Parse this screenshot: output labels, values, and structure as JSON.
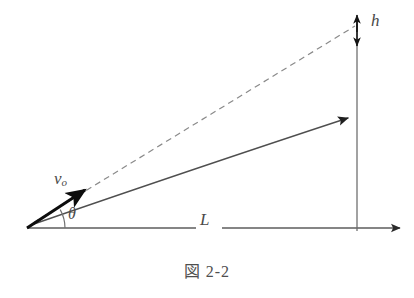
{
  "figure": {
    "caption": "図 2-2",
    "background_color": "#ffffff",
    "stroke_color": "#595959",
    "vector_color": "#111111",
    "label_color": "#4a4a4a"
  },
  "labels": {
    "initial_velocity": "v",
    "initial_velocity_subscript": "o",
    "launch_angle": "θ",
    "horizontal_distance": "L",
    "height": "h"
  },
  "geometry": {
    "origin_x": 27,
    "origin_y": 228,
    "baseline_end_x": 400,
    "baseline_y": 228,
    "vertical_line_x": 357,
    "vertical_line_top_y": 22,
    "trajectory_end_x": 357,
    "trajectory_end_y": 117,
    "dashed_end_x": 357,
    "dashed_end_y": 27,
    "velocity_arrow_end_x": 88,
    "velocity_arrow_end_y": 188,
    "angle_arc_radius": 38
  }
}
